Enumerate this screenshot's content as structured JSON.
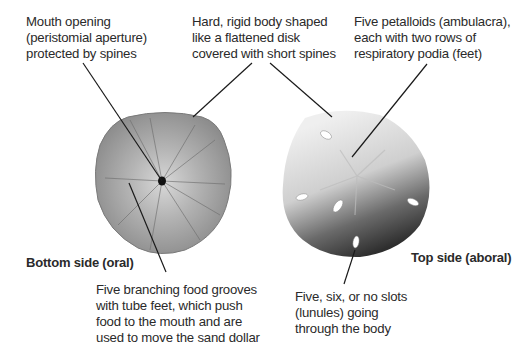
{
  "diagram": {
    "callouts": [
      {
        "id": "mouth",
        "text": "Mouth opening\n(peristomial aperture)\nprotected by spines"
      },
      {
        "id": "body",
        "text": "Hard, rigid body shaped\nlike a flattened disk\ncovered with short spines"
      },
      {
        "id": "petalloids",
        "text": "Five petalloids (ambulacra),\neach with two rows of\nrespiratory podia (feet)"
      },
      {
        "id": "food_grooves",
        "text": "Five branching food grooves\nwith tube feet, which push\nfood to the mouth and are\nused to move the sand dollar"
      },
      {
        "id": "lunules",
        "text": "Five, six, or no slots\n(lunules) going\nthrough the body"
      }
    ],
    "views": {
      "bottom": "Bottom side (oral)",
      "top": "Top side (aboral)"
    },
    "colors": {
      "leader_line": "#1a1a1a",
      "bottom_shell": "#9a9a9a",
      "top_shell_light": "#e6e6e6",
      "top_shell_dark": "#3a3a3a"
    }
  }
}
